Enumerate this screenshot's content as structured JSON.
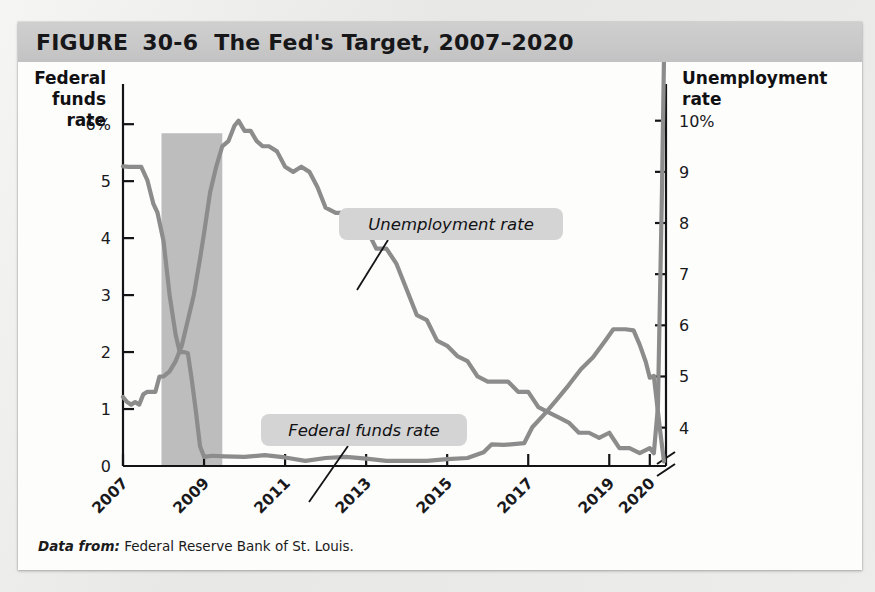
{
  "figure": {
    "label": "FIGURE",
    "number": "30-6",
    "title": "The Fed's Target, 2007–2020",
    "source_label": "Data from:",
    "source_text": "Federal Reserve Bank of St. Louis."
  },
  "chart_data": {
    "type": "line",
    "title": "The Fed's Target, 2007–2020",
    "xlabel": "Year",
    "grid": false,
    "legend": "inline-callouts",
    "x_ticks": [
      "2007",
      "2009",
      "2011",
      "2013",
      "2015",
      "2017",
      "2019",
      "2020"
    ],
    "x_tick_values": [
      2007,
      2009,
      2011,
      2013,
      2015,
      2017,
      2019,
      2020
    ],
    "xlim": [
      2007,
      2020.4
    ],
    "left_axis": {
      "title_lines": [
        "Federal",
        "funds",
        "rate"
      ],
      "ticks": [
        "6%",
        "5",
        "4",
        "3",
        "2",
        "1",
        "0"
      ],
      "tick_values": [
        6,
        5,
        4,
        3,
        2,
        1,
        0
      ],
      "ylim": [
        0,
        6.6
      ]
    },
    "right_axis": {
      "title_lines": [
        "Unemployment",
        "rate"
      ],
      "ticks": [
        "10%",
        "9",
        "8",
        "7",
        "6",
        "5",
        "4"
      ],
      "tick_values": [
        10,
        9,
        8,
        7,
        6,
        5,
        4
      ],
      "ylim": [
        3.25,
        10.6
      ],
      "axis_break": true
    },
    "shaded_region": {
      "name": "recession-band",
      "x_start": 2007.95,
      "x_end": 2009.45,
      "y_top_fraction": 0.885,
      "color": "#bdbdbd"
    },
    "annotations": [
      {
        "name": "unemployment-rate-callout",
        "text": "Unemployment rate",
        "box_x": 321,
        "box_y": 146,
        "box_w": 224,
        "box_h": 32,
        "leader_from": [
          370,
          178
        ],
        "leader_to": [
          339,
          228
        ]
      },
      {
        "name": "federal-funds-rate-callout",
        "text": "Federal funds rate",
        "box_x": 243,
        "box_y": 352,
        "box_w": 206,
        "box_h": 32,
        "leader_from": [
          330,
          384
        ],
        "leader_to": [
          291,
          440
        ]
      }
    ],
    "series": [
      {
        "name": "Federal funds rate",
        "axis": "left",
        "color": "#8c8c8c",
        "units": "percent",
        "x": [
          2007.0,
          2007.15,
          2007.3,
          2007.45,
          2007.6,
          2007.75,
          2007.85,
          2008.0,
          2008.15,
          2008.3,
          2008.4,
          2008.5,
          2008.6,
          2008.7,
          2008.8,
          2008.9,
          2009.0,
          2009.2,
          2009.5,
          2010.0,
          2010.5,
          2011.0,
          2011.5,
          2012.0,
          2012.5,
          2013.0,
          2013.5,
          2014.0,
          2014.5,
          2015.0,
          2015.5,
          2015.9,
          2016.1,
          2016.4,
          2016.9,
          2017.1,
          2017.4,
          2017.7,
          2018.0,
          2018.3,
          2018.6,
          2018.9,
          2019.1,
          2019.4,
          2019.6,
          2019.75,
          2019.9,
          2020.0,
          2020.1,
          2020.25,
          2020.35
        ],
        "y": [
          5.26,
          5.25,
          5.25,
          5.25,
          5.02,
          4.6,
          4.45,
          3.95,
          3.0,
          2.3,
          2.0,
          2.0,
          1.98,
          1.5,
          0.95,
          0.35,
          0.16,
          0.18,
          0.17,
          0.16,
          0.19,
          0.15,
          0.09,
          0.14,
          0.16,
          0.13,
          0.09,
          0.09,
          0.09,
          0.12,
          0.14,
          0.24,
          0.38,
          0.37,
          0.4,
          0.68,
          0.91,
          1.16,
          1.42,
          1.7,
          1.91,
          2.2,
          2.4,
          2.4,
          2.38,
          2.13,
          1.83,
          1.55,
          1.58,
          0.65,
          0.08
        ]
      },
      {
        "name": "Unemployment rate",
        "axis": "right",
        "color": "#8c8c8c",
        "units": "percent",
        "x": [
          2007.0,
          2007.1,
          2007.2,
          2007.3,
          2007.4,
          2007.5,
          2007.6,
          2007.7,
          2007.8,
          2007.9,
          2008.0,
          2008.15,
          2008.3,
          2008.45,
          2008.6,
          2008.75,
          2008.9,
          2009.0,
          2009.15,
          2009.3,
          2009.45,
          2009.6,
          2009.75,
          2009.85,
          2010.0,
          2010.15,
          2010.3,
          2010.45,
          2010.6,
          2010.8,
          2011.0,
          2011.2,
          2011.4,
          2011.6,
          2011.8,
          2012.0,
          2012.25,
          2012.5,
          2012.75,
          2013.0,
          2013.25,
          2013.5,
          2013.75,
          2014.0,
          2014.25,
          2014.5,
          2014.75,
          2015.0,
          2015.25,
          2015.5,
          2015.75,
          2016.0,
          2016.25,
          2016.5,
          2016.75,
          2017.0,
          2017.25,
          2017.5,
          2017.75,
          2018.0,
          2018.25,
          2018.5,
          2018.75,
          2019.0,
          2019.25,
          2019.5,
          2019.75,
          2020.0,
          2020.1,
          2020.2,
          2020.3,
          2020.35
        ],
        "y": [
          4.6,
          4.5,
          4.45,
          4.5,
          4.45,
          4.65,
          4.7,
          4.7,
          4.7,
          5.0,
          5.0,
          5.1,
          5.3,
          5.6,
          6.1,
          6.6,
          7.3,
          7.8,
          8.6,
          9.1,
          9.5,
          9.6,
          9.9,
          10.0,
          9.8,
          9.8,
          9.6,
          9.5,
          9.5,
          9.4,
          9.1,
          9.0,
          9.1,
          9.0,
          8.7,
          8.3,
          8.2,
          8.2,
          7.8,
          7.9,
          7.5,
          7.5,
          7.2,
          6.7,
          6.2,
          6.1,
          5.7,
          5.6,
          5.4,
          5.3,
          5.0,
          4.9,
          4.9,
          4.9,
          4.7,
          4.7,
          4.4,
          4.3,
          4.2,
          4.1,
          3.9,
          3.9,
          3.8,
          3.9,
          3.6,
          3.6,
          3.5,
          3.6,
          3.5,
          4.4,
          8.6,
          11.2
        ]
      }
    ]
  },
  "axis_labels": {
    "year": "Year"
  }
}
